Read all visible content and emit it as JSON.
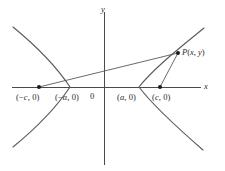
{
  "figure": {
    "name": "hyperbola-focal-definition",
    "caption": "",
    "background_color": "#ffffff",
    "axis_color": "#4a4a4a",
    "curve_color": "#5b5b5b",
    "ray_color": "#4f4f4f",
    "dot_color": "#1a1a1a",
    "text_color": "#2b2b2b"
  },
  "axes": {
    "x_label": "x",
    "y_label": "y",
    "origin_label": "0"
  },
  "labels": {
    "focus_left": "(−c, 0)",
    "vertex_left": "(−a, 0)",
    "vertex_right": "(a, 0)",
    "focus_right": "(c, 0)",
    "point_p": "P(x, y)"
  },
  "chart_data": {
    "type": "line",
    "title": "",
    "xlabel": "x",
    "ylabel": "y",
    "grid": false,
    "legend": "none",
    "xlim": [
      -3.2,
      3.2
    ],
    "ylim": [
      -2.6,
      2.6
    ],
    "curves": [
      {
        "name": "hyperbola-left-branch",
        "equation": "x^2/a^2 - y^2/b^2 = 1, x <= -a",
        "opens": "left",
        "vertex": [
          -1.0,
          0
        ]
      },
      {
        "name": "hyperbola-right-branch",
        "equation": "x^2/a^2 - y^2/b^2 = 1, x >= a",
        "opens": "right",
        "vertex": [
          1.0,
          0
        ]
      }
    ],
    "segments": [
      {
        "name": "focal-radius-from-left-focus",
        "from_label": "(−c, 0)",
        "to_label": "P(x, y)",
        "from": [
          -1.55,
          0
        ],
        "to": [
          2.05,
          1.05
        ]
      },
      {
        "name": "focal-radius-from-right-focus",
        "from_label": "(c, 0)",
        "to_label": "P(x, y)",
        "from": [
          1.55,
          0
        ],
        "to": [
          2.05,
          1.05
        ]
      }
    ],
    "points": [
      {
        "name": "left-focus",
        "label": "(−c, 0)",
        "x": -1.55,
        "y": 0.0,
        "marker": "filled-dot"
      },
      {
        "name": "right-focus",
        "label": "(c, 0)",
        "x": 1.55,
        "y": 0.0,
        "marker": "filled-dot"
      },
      {
        "name": "point-p",
        "label": "P(x, y)",
        "x": 2.05,
        "y": 1.05,
        "marker": "filled-dot"
      }
    ],
    "unlabeled_markers": [
      {
        "name": "left-vertex",
        "x": -1.0,
        "y": 0.0,
        "marker": "none",
        "label": "(−a, 0)"
      },
      {
        "name": "right-vertex",
        "x": 1.0,
        "y": 0.0,
        "marker": "none",
        "label": "(a, 0)"
      }
    ]
  }
}
